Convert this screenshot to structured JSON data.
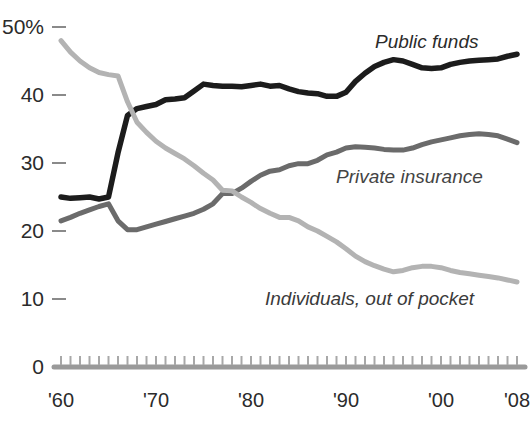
{
  "chart_data": {
    "type": "line",
    "title": "",
    "xlabel": "",
    "ylabel": "",
    "ylim": [
      0,
      50
    ],
    "xlim": [
      1960,
      2008
    ],
    "grid": false,
    "legend_position": "inline-annotations",
    "y_tick_labels": [
      "50%",
      "40",
      "30",
      "20",
      "10",
      "0"
    ],
    "y_tick_values": [
      50,
      40,
      30,
      20,
      10,
      0
    ],
    "x_tick_labels": [
      "'60",
      "'70",
      "'80",
      "'90",
      "'00",
      "'08"
    ],
    "x_tick_values": [
      1960,
      1970,
      1980,
      1990,
      2000,
      2008
    ],
    "x_minor_ticks_every": 1,
    "x": [
      1960,
      1961,
      1962,
      1963,
      1964,
      1965,
      1966,
      1967,
      1968,
      1969,
      1970,
      1971,
      1972,
      1973,
      1974,
      1975,
      1976,
      1977,
      1978,
      1979,
      1980,
      1981,
      1982,
      1983,
      1984,
      1985,
      1986,
      1987,
      1988,
      1989,
      1990,
      1991,
      1992,
      1993,
      1994,
      1995,
      1996,
      1997,
      1998,
      1999,
      2000,
      2001,
      2002,
      2003,
      2004,
      2005,
      2006,
      2007,
      2008
    ],
    "series": [
      {
        "name": "Public funds",
        "color": "#1c1c1c",
        "label_text": "Public funds",
        "end_value": 46,
        "values": [
          25.0,
          24.8,
          24.9,
          25.0,
          24.7,
          25.0,
          31.5,
          37.0,
          38.0,
          38.3,
          38.6,
          39.3,
          39.4,
          39.6,
          40.6,
          41.6,
          41.4,
          41.3,
          41.3,
          41.2,
          41.4,
          41.6,
          41.3,
          41.4,
          40.9,
          40.5,
          40.3,
          40.2,
          39.8,
          39.8,
          40.4,
          42.0,
          43.2,
          44.2,
          44.8,
          45.2,
          45.0,
          44.5,
          44.0,
          43.9,
          44.0,
          44.5,
          44.8,
          45.0,
          45.1,
          45.2,
          45.3,
          45.7,
          46.0
        ]
      },
      {
        "name": "Private insurance",
        "color": "#6b6b6b",
        "label_text": "Private insurance",
        "end_value": 33,
        "values": [
          21.5,
          22.0,
          22.6,
          23.1,
          23.6,
          24.0,
          21.5,
          20.2,
          20.2,
          20.6,
          21.0,
          21.4,
          21.8,
          22.2,
          22.6,
          23.2,
          24.0,
          25.5,
          25.5,
          26.3,
          27.3,
          28.2,
          28.8,
          29.0,
          29.6,
          29.9,
          29.9,
          30.4,
          31.2,
          31.6,
          32.2,
          32.4,
          32.3,
          32.2,
          32.0,
          31.9,
          31.9,
          32.2,
          32.7,
          33.1,
          33.4,
          33.7,
          34.0,
          34.2,
          34.3,
          34.2,
          34.0,
          33.5,
          33.0
        ]
      },
      {
        "name": "Individuals, out of pocket",
        "color": "#b3b3b3",
        "label_text": "Individuals, out of pocket",
        "end_value": 12.5,
        "values": [
          48.0,
          46.3,
          45.0,
          44.0,
          43.3,
          43.0,
          42.8,
          39.0,
          36.0,
          34.5,
          33.2,
          32.2,
          31.4,
          30.6,
          29.6,
          28.5,
          27.5,
          26.0,
          25.9,
          25.0,
          24.2,
          23.3,
          22.6,
          22.0,
          22.0,
          21.5,
          20.6,
          20.0,
          19.2,
          18.4,
          17.4,
          16.3,
          15.5,
          14.9,
          14.4,
          14.0,
          14.2,
          14.6,
          14.8,
          14.8,
          14.6,
          14.2,
          13.9,
          13.7,
          13.5,
          13.3,
          13.1,
          12.8,
          12.5
        ]
      }
    ]
  }
}
